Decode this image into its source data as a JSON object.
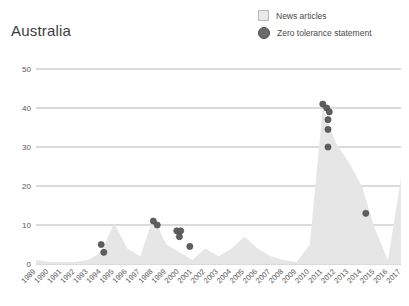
{
  "header": {
    "title": "Australia"
  },
  "legend": {
    "position": "top-right",
    "items": [
      {
        "label": "News articles",
        "marker": "square",
        "color": "#e9e9e9",
        "border": "#b9b9b9",
        "name": "legend-news-articles"
      },
      {
        "label": "Zero tolerance statement",
        "marker": "circle",
        "color": "#6b6b6b",
        "border": "#4f4f4f",
        "name": "legend-zero-tolerance-statement"
      }
    ]
  },
  "chart_data": {
    "type": "area",
    "title": "Australia",
    "xlabel": "",
    "ylabel": "",
    "grid": true,
    "legend_position": "top-right",
    "xlim": [
      1989,
      2017
    ],
    "ylim": [
      0,
      50
    ],
    "yticks": [
      0,
      10,
      20,
      30,
      40,
      50
    ],
    "ytick_labels": [
      "0",
      "10",
      "20",
      "30",
      "40",
      "50"
    ],
    "categories": [
      "1989",
      "1990",
      "1991",
      "1992",
      "1993",
      "1994",
      "1995",
      "1996",
      "1997",
      "1998",
      "1999",
      "2000",
      "2001",
      "2002",
      "2003",
      "2004",
      "2005",
      "2006",
      "2007",
      "2008",
      "2009",
      "2010",
      "2011",
      "2012",
      "2013",
      "2014",
      "2015",
      "2016",
      "2017"
    ],
    "series": [
      {
        "name": "News articles",
        "type": "area",
        "color": "#e6e6e6",
        "values": [
          1,
          0.5,
          0.5,
          0.5,
          1,
          3,
          10.5,
          4,
          2,
          12,
          5,
          3,
          1,
          4,
          2,
          4,
          7,
          4,
          2,
          1,
          0.5,
          5,
          40,
          31,
          26,
          20,
          9,
          1,
          22
        ]
      },
      {
        "name": "Zero tolerance statement",
        "type": "scatter",
        "color": "#5f5f5f",
        "points": [
          {
            "x": 1994.0,
            "y": 5
          },
          {
            "x": 1994.2,
            "y": 3
          },
          {
            "x": 1998.0,
            "y": 11
          },
          {
            "x": 1998.3,
            "y": 10
          },
          {
            "x": 1999.8,
            "y": 8.5
          },
          {
            "x": 2000.1,
            "y": 8.5
          },
          {
            "x": 2000.0,
            "y": 7
          },
          {
            "x": 2000.8,
            "y": 4.5
          },
          {
            "x": 2011.0,
            "y": 41
          },
          {
            "x": 2011.3,
            "y": 40
          },
          {
            "x": 2011.5,
            "y": 39
          },
          {
            "x": 2011.4,
            "y": 37
          },
          {
            "x": 2011.4,
            "y": 34.5
          },
          {
            "x": 2011.4,
            "y": 30
          },
          {
            "x": 2014.3,
            "y": 13
          }
        ]
      }
    ]
  }
}
